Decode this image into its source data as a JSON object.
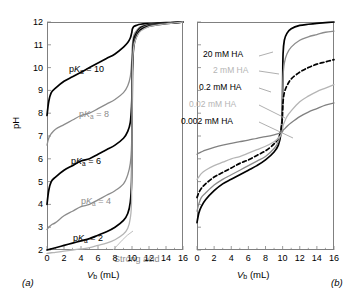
{
  "figure": {
    "panel_a_tag": "(a)",
    "panel_b_tag": "(b)",
    "y_axis_title": "pH",
    "x_axis_title_main": "V",
    "x_axis_title_sub": "b",
    "x_axis_title_unit": " (mL)"
  },
  "axes": {
    "y_ticks": [
      2,
      3,
      4,
      5,
      6,
      7,
      8,
      9,
      10,
      11,
      12
    ],
    "y_tick_labels": [
      "2",
      "3",
      "4",
      "5",
      "6",
      "7",
      "8",
      "9",
      "10",
      "11",
      "12"
    ],
    "x_ticks": [
      0,
      2,
      4,
      6,
      8,
      10,
      12,
      14,
      16
    ],
    "x_tick_labels": [
      "0",
      "2",
      "4",
      "6",
      "8",
      "10",
      "12",
      "14",
      "16"
    ],
    "xlim": [
      0,
      16
    ],
    "ylim": [
      2,
      12
    ],
    "y_ticks_labeled_panel_b": false
  },
  "colors": {
    "black": "#000000",
    "gray": "#808080",
    "mid_gray": "#8c8c8c",
    "light_gray": "#b5b5b5",
    "axis": "#808080",
    "background": "#ffffff"
  },
  "annotations_a": [
    {
      "text_pre": "p",
      "text_ital": "K",
      "text_sub": "a",
      "text_post": " = 10",
      "color": "black",
      "x": 22,
      "y": 42
    },
    {
      "text_pre": "p",
      "text_ital": "K",
      "text_sub": "a",
      "text_post": " = 8",
      "color": "gray",
      "x": 32,
      "y": 87
    },
    {
      "text_pre": "p",
      "text_ital": "K",
      "text_sub": "a",
      "text_post": " = 6",
      "color": "black",
      "x": 24,
      "y": 134
    },
    {
      "text_pre": "p",
      "text_ital": "K",
      "text_sub": "a",
      "text_post": " = 4",
      "color": "gray",
      "x": 34,
      "y": 174
    },
    {
      "text_pre": "p",
      "text_ital": "K",
      "text_sub": "a",
      "text_post": " = 2",
      "color": "black",
      "x": 26,
      "y": 211
    },
    {
      "text_plain": "Strong acid",
      "color": "gray",
      "x": 67,
      "y": 232
    }
  ],
  "annotations_b": [
    {
      "text": "20 mM HA",
      "color": "black",
      "x": 6,
      "y": 28
    },
    {
      "text": "2 mM HA",
      "color": "light_gray",
      "x": 16,
      "y": 44
    },
    {
      "text": "0.2 mM HA",
      "color": "black",
      "x": 2,
      "y": 61
    },
    {
      "text": "0.02 mM HA",
      "color": "light_gray",
      "x": -8,
      "y": 78
    },
    {
      "text": "0.002 mM HA",
      "color": "black",
      "x": -16,
      "y": 95
    }
  ],
  "chart_data": {
    "type": "line",
    "title": "",
    "panels": [
      {
        "tag": "(a)",
        "xlabel": "Vb (mL)",
        "ylabel": "pH",
        "xlim": [
          0,
          16
        ],
        "ylim": [
          2,
          12
        ],
        "xticks": [
          0,
          2,
          4,
          6,
          8,
          10,
          12,
          14,
          16
        ],
        "yticks": [
          2,
          3,
          4,
          5,
          6,
          7,
          8,
          9,
          10,
          11,
          12
        ],
        "grid": false,
        "legend": "inline-annotations",
        "description": "Titration curves of weak acids of varying pKa with strong base; equivalence volume 10 mL",
        "series": [
          {
            "name": "pKa = 10",
            "color": "#000000",
            "style": "solid",
            "x": [
              0,
              0.2,
              0.5,
              1,
              2,
              3,
              4,
              5,
              6,
              7,
              8,
              9,
              9.5,
              9.8,
              9.95,
              10,
              10.05,
              10.2,
              10.5,
              11,
              12,
              13,
              14,
              15,
              16
            ],
            "y": [
              7.9,
              8.5,
              8.9,
              9.1,
              9.4,
              9.6,
              9.8,
              10.0,
              10.2,
              10.4,
              10.6,
              10.9,
              11.1,
              11.3,
              11.5,
              11.6,
              11.7,
              11.8,
              11.85,
              11.9,
              11.93,
              11.95,
              11.97,
              11.98,
              12.0
            ]
          },
          {
            "name": "pKa = 8",
            "color": "#8c8c8c",
            "style": "solid",
            "x": [
              0,
              0.2,
              0.5,
              1,
              2,
              3,
              4,
              5,
              6,
              7,
              8,
              9,
              9.5,
              9.8,
              9.95,
              10,
              10.05,
              10.2,
              10.5,
              11,
              12,
              13,
              14,
              15,
              16
            ],
            "y": [
              6.6,
              6.9,
              7.1,
              7.3,
              7.5,
              7.7,
              7.9,
              8.0,
              8.2,
              8.4,
              8.6,
              8.9,
              9.2,
              9.6,
              10.2,
              10.6,
              11.0,
              11.4,
              11.6,
              11.8,
              11.9,
              11.93,
              11.95,
              11.97,
              12.0
            ]
          },
          {
            "name": "pKa = 6",
            "color": "#000000",
            "style": "solid",
            "x": [
              0,
              0.2,
              0.5,
              1,
              2,
              3,
              4,
              5,
              6,
              7,
              8,
              9,
              9.5,
              9.8,
              9.95,
              10,
              10.05,
              10.2,
              10.5,
              11,
              12,
              13,
              14,
              15,
              16
            ],
            "y": [
              4.0,
              4.6,
              5.0,
              5.2,
              5.5,
              5.7,
              5.9,
              6.0,
              6.2,
              6.4,
              6.6,
              6.9,
              7.2,
              7.6,
              8.3,
              9.0,
              10.2,
              11.2,
              11.5,
              11.75,
              11.88,
              11.92,
              11.95,
              11.97,
              12.0
            ]
          },
          {
            "name": "pKa = 4",
            "color": "#8c8c8c",
            "style": "solid",
            "x": [
              0,
              0.2,
              0.5,
              1,
              2,
              3,
              4,
              5,
              6,
              7,
              8,
              9,
              9.5,
              9.8,
              9.95,
              10,
              10.05,
              10.2,
              10.5,
              11,
              12,
              13,
              14,
              15,
              16
            ],
            "y": [
              2.9,
              3.0,
              3.1,
              3.2,
              3.5,
              3.7,
              3.9,
              4.0,
              4.2,
              4.4,
              4.6,
              4.9,
              5.3,
              5.8,
              6.6,
              8.3,
              10.0,
              11.0,
              11.4,
              11.7,
              11.85,
              11.9,
              11.94,
              11.97,
              12.0
            ]
          },
          {
            "name": "pKa = 2",
            "color": "#000000",
            "style": "solid",
            "x": [
              0,
              0.2,
              0.5,
              1,
              2,
              3,
              4,
              5,
              6,
              7,
              8,
              9,
              9.5,
              9.8,
              9.95,
              10,
              10.05,
              10.2,
              10.5,
              11,
              12,
              13,
              14,
              15,
              16
            ],
            "y": [
              2.0,
              2.02,
              2.05,
              2.1,
              2.2,
              2.3,
              2.4,
              2.5,
              2.65,
              2.8,
              3.0,
              3.3,
              3.6,
              4.1,
              5.0,
              7.0,
              9.8,
              10.9,
              11.35,
              11.65,
              11.82,
              11.88,
              11.93,
              11.96,
              12.0
            ]
          },
          {
            "name": "Strong acid",
            "color": "#b5b5b5",
            "style": "solid",
            "x": [
              0,
              0.5,
              1,
              2,
              3,
              4,
              5,
              6,
              7,
              8,
              9,
              9.5,
              9.8,
              9.95,
              10,
              10.05,
              10.2,
              10.5,
              11,
              12,
              13,
              14,
              15,
              16
            ],
            "y": [
              1.85,
              1.88,
              1.9,
              1.95,
              2.0,
              2.05,
              2.1,
              2.2,
              2.3,
              2.45,
              2.7,
              2.95,
              3.4,
              4.2,
              7.0,
              9.9,
              10.9,
              11.3,
              11.6,
              11.8,
              11.87,
              11.92,
              11.96,
              12.0
            ]
          }
        ]
      },
      {
        "tag": "(b)",
        "xlabel": "Vb (mL)",
        "ylabel": "pH",
        "xlim": [
          0,
          16
        ],
        "ylim": [
          2,
          12
        ],
        "xticks": [
          0,
          2,
          4,
          6,
          8,
          10,
          12,
          14,
          16
        ],
        "yticks": [
          2,
          3,
          4,
          5,
          6,
          7,
          8,
          9,
          10,
          11,
          12
        ],
        "grid": false,
        "legend": "inline-annotations-with-leaders",
        "description": "Effect of decreasing weak-acid concentration on titration curve sharpness; equivalence volume 10 mL",
        "series": [
          {
            "name": "20 mM HA",
            "color": "#000000",
            "style": "solid",
            "x": [
              0,
              0.2,
              0.5,
              1,
              2,
              3,
              4,
              5,
              6,
              7,
              8,
              9,
              9.5,
              9.8,
              9.95,
              10,
              10.05,
              10.2,
              10.5,
              11,
              12,
              13,
              14,
              15,
              16
            ],
            "y": [
              3.2,
              3.6,
              3.9,
              4.2,
              4.6,
              4.9,
              5.1,
              5.3,
              5.5,
              5.7,
              5.95,
              6.3,
              6.6,
              7.1,
              8.0,
              9.2,
              10.6,
              11.2,
              11.5,
              11.7,
              11.85,
              11.9,
              11.94,
              11.97,
              12.0
            ]
          },
          {
            "name": "2 mM HA",
            "color": "#8c8c8c",
            "style": "solid",
            "x": [
              0,
              0.2,
              0.5,
              1,
              2,
              3,
              4,
              5,
              6,
              7,
              8,
              9,
              9.5,
              9.8,
              9.95,
              10,
              10.05,
              10.2,
              10.5,
              11,
              12,
              13,
              14,
              15,
              16
            ],
            "y": [
              3.7,
              4.0,
              4.3,
              4.5,
              4.85,
              5.1,
              5.3,
              5.5,
              5.7,
              5.9,
              6.1,
              6.45,
              6.75,
              7.2,
              7.9,
              8.7,
              9.6,
              10.2,
              10.6,
              10.9,
              11.2,
              11.35,
              11.45,
              11.55,
              11.6
            ]
          },
          {
            "name": "0.2 mM HA",
            "color": "#000000",
            "style": "dashed",
            "x": [
              0,
              0.2,
              0.5,
              1,
              2,
              3,
              4,
              5,
              6,
              7,
              8,
              9,
              9.5,
              9.8,
              9.95,
              10,
              10.05,
              10.2,
              10.5,
              11,
              12,
              13,
              14,
              15,
              16
            ],
            "y": [
              4.3,
              4.5,
              4.7,
              4.9,
              5.2,
              5.4,
              5.6,
              5.8,
              5.95,
              6.15,
              6.35,
              6.65,
              6.9,
              7.25,
              7.7,
              8.1,
              8.5,
              8.9,
              9.2,
              9.5,
              9.8,
              10.0,
              10.15,
              10.25,
              10.35
            ]
          },
          {
            "name": "0.02 mM HA",
            "color": "#b5b5b5",
            "style": "solid",
            "x": [
              0,
              0.2,
              0.5,
              1,
              2,
              3,
              4,
              5,
              6,
              7,
              8,
              9,
              9.5,
              9.8,
              9.95,
              10,
              10.05,
              10.2,
              10.5,
              11,
              12,
              13,
              14,
              15,
              16
            ],
            "y": [
              5.1,
              5.2,
              5.35,
              5.5,
              5.7,
              5.85,
              6.0,
              6.1,
              6.25,
              6.4,
              6.55,
              6.75,
              6.9,
              7.05,
              7.2,
              7.3,
              7.45,
              7.6,
              7.85,
              8.1,
              8.5,
              8.75,
              8.95,
              9.1,
              9.25
            ]
          },
          {
            "name": "0.002 mM HA",
            "color": "#808080",
            "style": "solid",
            "x": [
              0,
              0.2,
              0.5,
              1,
              2,
              3,
              4,
              5,
              6,
              7,
              8,
              9,
              9.5,
              9.8,
              9.95,
              10,
              10.05,
              10.2,
              10.5,
              11,
              12,
              13,
              14,
              15,
              16
            ],
            "y": [
              6.2,
              6.25,
              6.3,
              6.38,
              6.5,
              6.6,
              6.68,
              6.75,
              6.82,
              6.9,
              6.97,
              7.05,
              7.1,
              7.15,
              7.18,
              7.2,
              7.25,
              7.3,
              7.42,
              7.58,
              7.85,
              8.05,
              8.2,
              8.35,
              8.45
            ]
          }
        ]
      }
    ]
  }
}
